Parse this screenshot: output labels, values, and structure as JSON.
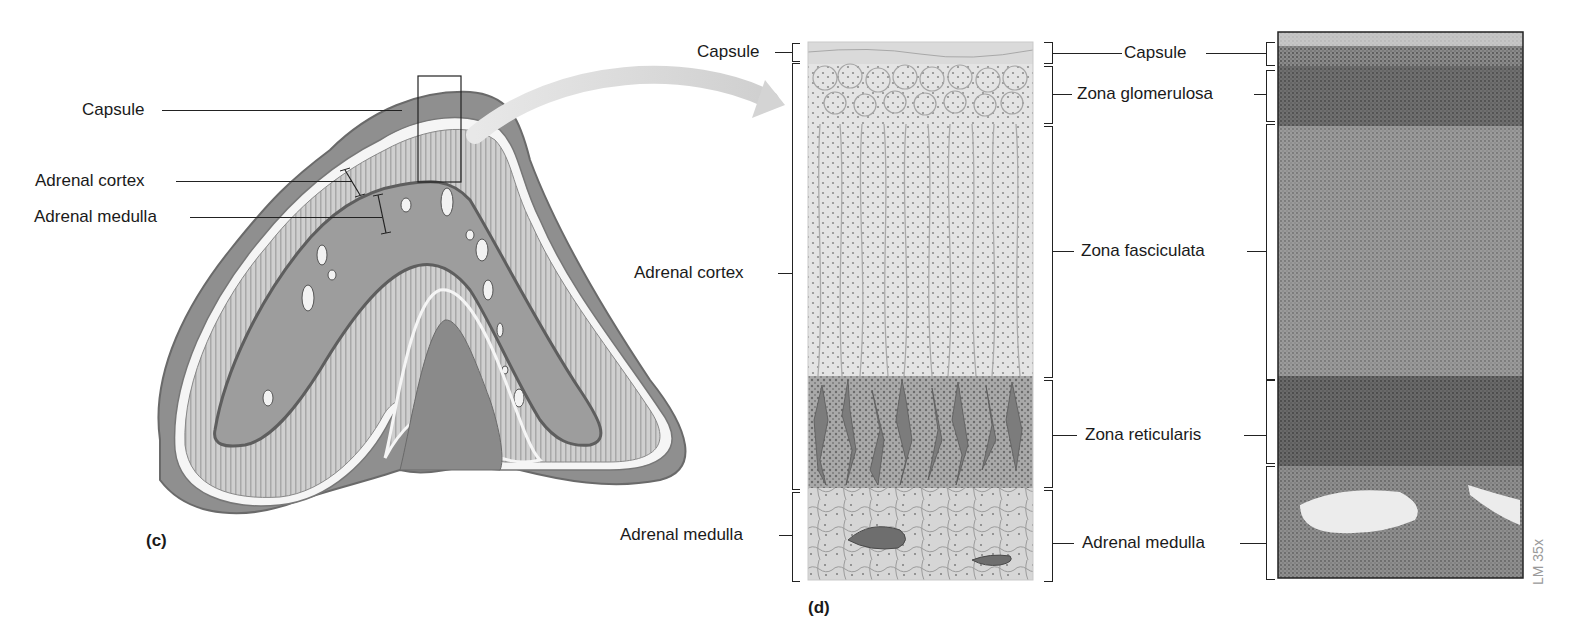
{
  "panel_c": {
    "letter": "(c)",
    "labels": {
      "capsule": "Capsule",
      "cortex": "Adrenal cortex",
      "medulla": "Adrenal medulla"
    }
  },
  "panel_d": {
    "letter": "(d)",
    "left_labels": {
      "capsule": "Capsule",
      "cortex": "Adrenal cortex",
      "medulla": "Adrenal medulla"
    },
    "zone_labels": {
      "capsule": "Capsule",
      "glomerulosa": "Zona glomerulosa",
      "fasciculata": "Zona fasciculata",
      "reticularis": "Zona reticularis",
      "medulla": "Adrenal medulla"
    }
  },
  "micrograph": {
    "magnification": "LM 35x"
  },
  "colors": {
    "text": "#1a1a1a",
    "lines": "#222222",
    "capsule_outer": "#8a8a8a",
    "cortex": "#c8c8c8",
    "medulla": "#9a9a9a",
    "micrograph": "#6e6e6e"
  }
}
